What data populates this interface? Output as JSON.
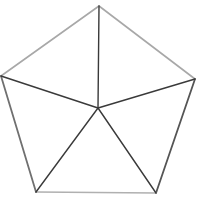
{
  "diagram": {
    "shape": "pentagon-with-center-spokes",
    "vertices": {
      "top": [
        99,
        6
      ],
      "right": [
        195,
        79
      ],
      "bottom_right": [
        156,
        193
      ],
      "bottom_left": [
        36,
        192
      ],
      "left": [
        1,
        76
      ]
    },
    "center": [
      98,
      108
    ],
    "colors": {
      "background": "#ffffff",
      "outer_edge": "#a8a8a8",
      "outer_edge_right": "#555555",
      "spoke": "#3a3a3a"
    }
  }
}
